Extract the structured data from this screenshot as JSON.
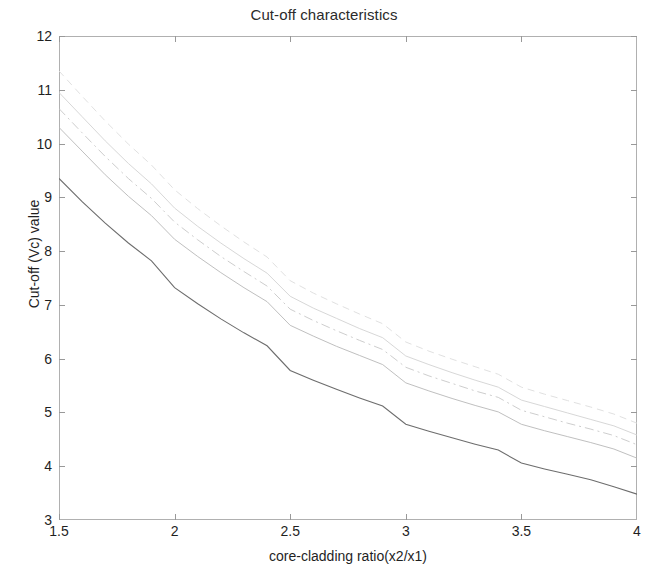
{
  "chart_data": {
    "type": "line",
    "title": "Cut-off characteristics",
    "xlabel": "core-cladding ratio(x2/x1)",
    "ylabel": "Cut-off (Vc) value",
    "xlim": [
      1.5,
      4
    ],
    "ylim": [
      3,
      12
    ],
    "xticks": [
      1.5,
      2,
      2.5,
      3,
      3.5,
      4
    ],
    "xtick_labels": [
      "1.5",
      "2",
      "2.5",
      "3",
      "3.5",
      "4"
    ],
    "yticks": [
      3,
      4,
      5,
      6,
      7,
      8,
      9,
      10,
      11,
      12
    ],
    "ytick_labels": [
      "3",
      "4",
      "5",
      "6",
      "7",
      "8",
      "9",
      "10",
      "11",
      "12"
    ],
    "grid": false,
    "legend": "none",
    "x": [
      1.5,
      1.6,
      1.7,
      1.8,
      1.9,
      2.0,
      2.1,
      2.2,
      2.3,
      2.4,
      2.5,
      2.6,
      2.7,
      2.8,
      2.9,
      3.0,
      3.1,
      3.2,
      3.3,
      3.4,
      3.5,
      3.6,
      3.7,
      3.8,
      3.9,
      4.0
    ],
    "series": [
      {
        "name": "curve-1",
        "color": "#6d6d6d",
        "style": "solid",
        "values": [
          9.35,
          8.92,
          8.52,
          8.15,
          7.82,
          7.32,
          7.02,
          6.74,
          6.48,
          6.24,
          5.78,
          5.6,
          5.43,
          5.27,
          5.12,
          4.78,
          4.65,
          4.53,
          4.41,
          4.3,
          4.06,
          3.95,
          3.85,
          3.75,
          3.62,
          3.48
        ]
      },
      {
        "name": "curve-2",
        "color": "#b8b8b8",
        "style": "solid",
        "values": [
          10.3,
          9.86,
          9.42,
          9.02,
          8.66,
          8.22,
          7.9,
          7.6,
          7.32,
          7.06,
          6.62,
          6.42,
          6.23,
          6.06,
          5.89,
          5.55,
          5.4,
          5.26,
          5.13,
          5.01,
          4.78,
          4.66,
          4.55,
          4.44,
          4.32,
          4.15
        ]
      },
      {
        "name": "curve-3",
        "color": "#c7c7c7",
        "style": "dashdot",
        "values": [
          10.65,
          10.2,
          9.76,
          9.35,
          8.98,
          8.54,
          8.21,
          7.9,
          7.62,
          7.35,
          6.92,
          6.71,
          6.52,
          6.34,
          6.17,
          5.84,
          5.68,
          5.54,
          5.4,
          5.28,
          5.04,
          4.92,
          4.8,
          4.69,
          4.57,
          4.4
        ]
      },
      {
        "name": "curve-4",
        "color": "#d2d2d2",
        "style": "solid",
        "values": [
          10.95,
          10.5,
          10.05,
          9.63,
          9.25,
          8.8,
          8.46,
          8.15,
          7.86,
          7.59,
          7.16,
          6.94,
          6.75,
          6.56,
          6.39,
          6.05,
          5.89,
          5.74,
          5.6,
          5.47,
          5.23,
          5.11,
          4.99,
          4.87,
          4.75,
          4.58
        ]
      },
      {
        "name": "curve-5",
        "color": "#dcdcdc",
        "style": "dashed",
        "values": [
          11.35,
          10.88,
          10.42,
          9.99,
          9.6,
          9.14,
          8.79,
          8.47,
          8.17,
          7.89,
          7.45,
          7.22,
          7.02,
          6.83,
          6.65,
          6.31,
          6.14,
          5.99,
          5.85,
          5.71,
          5.47,
          5.34,
          5.22,
          5.1,
          4.97,
          4.8
        ]
      }
    ]
  },
  "axes": {
    "frame_color": "#b0b0b0",
    "tick_color": "#999999"
  }
}
